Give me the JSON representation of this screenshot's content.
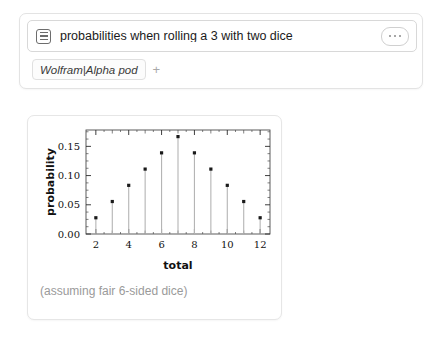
{
  "query": {
    "icon": "list-icon",
    "text": "probabilities when rolling a 3 with two dice",
    "placeholder": "Enter what you want to calculate or know about",
    "menu_icon": "ellipsis-icon"
  },
  "chip": {
    "label": "Wolfram|Alpha pod",
    "add_label": "+"
  },
  "result": {
    "caption": "(assuming fair 6-sided dice)"
  },
  "chart_data": {
    "type": "scatter",
    "title": "",
    "xlabel": "total",
    "ylabel": "probability",
    "x": [
      2,
      3,
      4,
      5,
      6,
      7,
      8,
      9,
      10,
      11,
      12
    ],
    "values": [
      0.0278,
      0.0556,
      0.0833,
      0.1111,
      0.1389,
      0.1667,
      0.1389,
      0.1111,
      0.0833,
      0.0556,
      0.0278
    ],
    "xlim": [
      1.4,
      12.6
    ],
    "ylim": [
      0,
      0.178
    ],
    "xticks": [
      2,
      4,
      6,
      8,
      10,
      12
    ],
    "xtick_labels": [
      "2",
      "4",
      "6",
      "8",
      "10",
      "12"
    ],
    "xminorticks": [
      3,
      5,
      7,
      9,
      11
    ],
    "yticks": [
      0.0,
      0.05,
      0.1,
      0.15
    ],
    "ytick_labels": [
      "0.00",
      "0.05",
      "0.10",
      "0.15"
    ],
    "grid": false,
    "legend": false,
    "frame": true,
    "marker_color": "#1a1a1a",
    "stem_color": "#b4b4b4"
  }
}
